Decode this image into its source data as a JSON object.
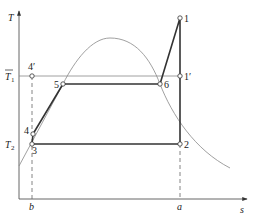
{
  "diagram": {
    "type": "T-s diagram",
    "axes": {
      "y_label": "T",
      "x_label": "s",
      "y_ticks": [
        {
          "name": "T1_bar",
          "label": "T",
          "subscript": "1",
          "overbar": true
        },
        {
          "name": "T2",
          "label": "T",
          "subscript": "2",
          "overbar": false
        }
      ],
      "x_ticks": [
        {
          "name": "b",
          "label": "b"
        },
        {
          "name": "a",
          "label": "a"
        }
      ]
    },
    "points": [
      {
        "id": "1",
        "label": "1"
      },
      {
        "id": "1prime",
        "label": "1′"
      },
      {
        "id": "2",
        "label": "2"
      },
      {
        "id": "3",
        "label": "3"
      },
      {
        "id": "4",
        "label": "4"
      },
      {
        "id": "4prime",
        "label": "4′"
      },
      {
        "id": "5",
        "label": "5"
      },
      {
        "id": "6",
        "label": "6"
      }
    ],
    "colors": {
      "cycle": "#333333",
      "curve": "#777777",
      "axis": "#444444",
      "guide": "#666666"
    }
  }
}
